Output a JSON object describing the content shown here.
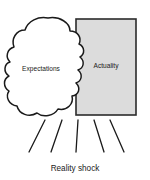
{
  "diagram": {
    "type": "concept-diagram",
    "background_color": "#ffffff",
    "cloud": {
      "label": "Expectations",
      "fill_color": "#ffffff",
      "stroke_color": "#1a1a1a",
      "label_x": 41,
      "label_y": 71
    },
    "rectangle": {
      "label": "Actuality",
      "fill_color": "#dcdcdc",
      "stroke_color": "#2b2b2b",
      "x": 76,
      "y": 19,
      "width": 60,
      "height": 96,
      "label_x": 106,
      "label_y": 68
    },
    "shock_rays": {
      "count": 5,
      "stroke_color": "#1a1a1a",
      "lines": [
        {
          "x1": 45,
          "y1": 120,
          "x2": 29,
          "y2": 152
        },
        {
          "x1": 62,
          "y1": 120,
          "x2": 51,
          "y2": 152
        },
        {
          "x1": 78,
          "y1": 120,
          "x2": 76,
          "y2": 152
        },
        {
          "x1": 94,
          "y1": 120,
          "x2": 104,
          "y2": 152
        },
        {
          "x1": 110,
          "y1": 120,
          "x2": 124,
          "y2": 152
        }
      ]
    },
    "caption": {
      "text": "Reality shock",
      "x": 75,
      "y": 171
    }
  }
}
